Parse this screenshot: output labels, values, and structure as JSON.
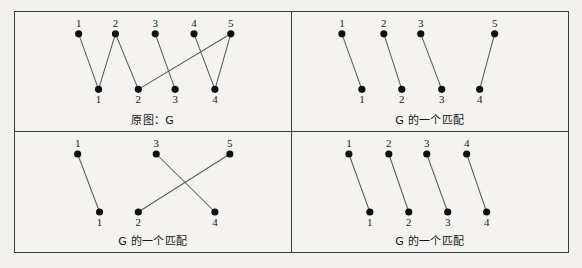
{
  "figure": {
    "background_color": "#f2f1ee",
    "frame_color": "#3a3a3a",
    "node_color": "#101014",
    "edge_color": "#5b5b60",
    "panels": [
      {
        "id": "original-graph",
        "caption": "原图：G",
        "top_nodes": [
          {
            "label": "1",
            "x": 64,
            "y": 22
          },
          {
            "label": "2",
            "x": 101,
            "y": 22
          },
          {
            "label": "3",
            "x": 141,
            "y": 22
          },
          {
            "label": "4",
            "x": 180,
            "y": 22
          },
          {
            "label": "5",
            "x": 217,
            "y": 22
          }
        ],
        "bottom_nodes": [
          {
            "label": "1",
            "x": 84,
            "y": 78
          },
          {
            "label": "2",
            "x": 124,
            "y": 78
          },
          {
            "label": "3",
            "x": 161,
            "y": 78
          },
          {
            "label": "4",
            "x": 201,
            "y": 78
          }
        ],
        "edges": [
          {
            "from": "1",
            "to": "1"
          },
          {
            "from": "2",
            "to": "1"
          },
          {
            "from": "2",
            "to": "2"
          },
          {
            "from": "3",
            "to": "3"
          },
          {
            "from": "4",
            "to": "4"
          },
          {
            "from": "5",
            "to": "4"
          },
          {
            "from": "5",
            "to": "2"
          }
        ]
      },
      {
        "id": "matching-1",
        "caption": "G 的一个匹配",
        "top_nodes": [
          {
            "label": "1",
            "x": 50,
            "y": 22
          },
          {
            "label": "2",
            "x": 92,
            "y": 22
          },
          {
            "label": "3",
            "x": 129,
            "y": 22
          },
          {
            "label": "5",
            "x": 203,
            "y": 22
          }
        ],
        "bottom_nodes": [
          {
            "label": "1",
            "x": 70,
            "y": 78
          },
          {
            "label": "2",
            "x": 110,
            "y": 78
          },
          {
            "label": "3",
            "x": 150,
            "y": 78
          },
          {
            "label": "4",
            "x": 188,
            "y": 78
          }
        ],
        "edges": [
          {
            "from": "1",
            "to": "1"
          },
          {
            "from": "2",
            "to": "2"
          },
          {
            "from": "3",
            "to": "3"
          },
          {
            "from": "5",
            "to": "4"
          }
        ]
      },
      {
        "id": "matching-2",
        "caption": "G 的一个匹配",
        "top_nodes": [
          {
            "label": "1",
            "x": 63,
            "y": 22
          },
          {
            "label": "3",
            "x": 142,
            "y": 22
          },
          {
            "label": "5",
            "x": 216,
            "y": 22
          }
        ],
        "bottom_nodes": [
          {
            "label": "1",
            "x": 85,
            "y": 80
          },
          {
            "label": "2",
            "x": 124,
            "y": 80
          },
          {
            "label": "4",
            "x": 201,
            "y": 80
          }
        ],
        "edges": [
          {
            "from": "1",
            "to": "1"
          },
          {
            "from": "3",
            "to": "4"
          },
          {
            "from": "5",
            "to": "2"
          }
        ]
      },
      {
        "id": "matching-3",
        "caption": "G 的一个匹配",
        "top_nodes": [
          {
            "label": "1",
            "x": 57,
            "y": 22
          },
          {
            "label": "2",
            "x": 97,
            "y": 22
          },
          {
            "label": "3",
            "x": 135,
            "y": 22
          },
          {
            "label": "4",
            "x": 175,
            "y": 22
          }
        ],
        "bottom_nodes": [
          {
            "label": "1",
            "x": 78,
            "y": 80
          },
          {
            "label": "2",
            "x": 117,
            "y": 80
          },
          {
            "label": "3",
            "x": 156,
            "y": 80
          },
          {
            "label": "4",
            "x": 195,
            "y": 80
          }
        ],
        "edges": [
          {
            "from": "1",
            "to": "1"
          },
          {
            "from": "2",
            "to": "2"
          },
          {
            "from": "3",
            "to": "3"
          },
          {
            "from": "4",
            "to": "4"
          }
        ]
      }
    ]
  }
}
